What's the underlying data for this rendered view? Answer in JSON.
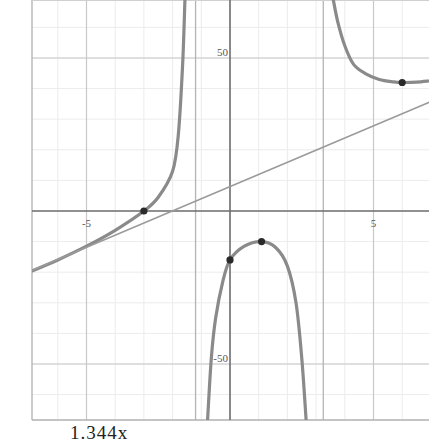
{
  "chart_data": {
    "type": "line",
    "title": "",
    "xlabel": "",
    "ylabel": "",
    "xlim": [
      -6.95,
      6.95
    ],
    "ylim": [
      -68.6,
      68.6
    ],
    "grid": true,
    "x_ticks": [
      {
        "value": -5,
        "label": "-5"
      },
      {
        "value": 5,
        "label": "5"
      }
    ],
    "y_ticks": [
      {
        "value": 50,
        "label": "50"
      },
      {
        "value": -50,
        "label": "-50"
      }
    ],
    "vertical_asymptotes": [
      -1.5,
      3.0
    ],
    "series": [
      {
        "name": "curve",
        "kind": "rational-function",
        "branches": [
          {
            "x": [
              -6.9,
              -6.0,
              -5.0,
              -4.0,
              -3.0,
              -2.5,
              -2.0,
              -1.8,
              -1.65,
              -1.57
            ],
            "y": [
              -19.6,
              -16.0,
              -11.5,
              -6.3,
              0.0,
              4.5,
              13.0,
              25.0,
              48.0,
              69.0
            ]
          },
          {
            "x": [
              -0.78,
              -0.65,
              -0.5,
              -0.25,
              0.0,
              0.5,
              1.1,
              1.6,
              2.0,
              2.3,
              2.5,
              2.65
            ],
            "y": [
              -68.0,
              -48.0,
              -35.0,
              -23.0,
              -16.0,
              -11.5,
              -10.0,
              -12.0,
              -18.0,
              -30.0,
              -48.0,
              -68.0
            ]
          },
          {
            "x": [
              3.6,
              3.75,
              4.0,
              4.3,
              4.7,
              5.2,
              5.7,
              6.0,
              6.5,
              6.95
            ],
            "y": [
              69.0,
              62.0,
              54.0,
              48.0,
              45.0,
              43.0,
              42.2,
              42.0,
              42.1,
              42.5
            ]
          }
        ]
      },
      {
        "name": "oblique-asymptote-line",
        "kind": "line",
        "x": [
          -6.95,
          6.95
        ],
        "y": [
          -19.6,
          35.6
        ]
      }
    ],
    "points": [
      {
        "x": -3.0,
        "y": 0.0
      },
      {
        "x": 0.0,
        "y": -16.0
      },
      {
        "x": 1.1,
        "y": -10.0
      },
      {
        "x": 6.0,
        "y": 42.0
      }
    ],
    "caption": "1.344x"
  },
  "style": {
    "curve_color": "#8a8a8a",
    "line_color": "#9a9a9a",
    "axis_color": "#6e6e6e",
    "grid_major_color": "#c8c8c8",
    "grid_minor_color": "#ececec",
    "point_color": "#2a2a2a"
  },
  "caption": {
    "text": "1.344x"
  }
}
